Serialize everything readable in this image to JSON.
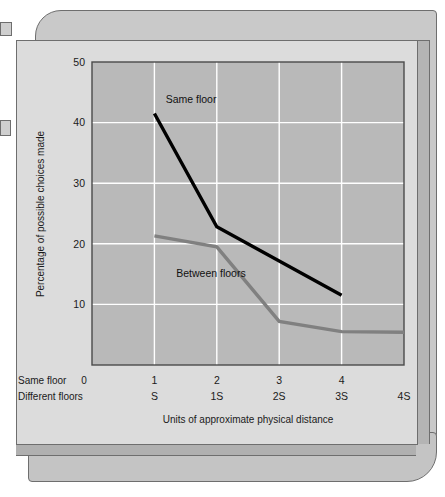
{
  "figure": {
    "kind": "printed-figure-card"
  },
  "chart_data": {
    "type": "line",
    "title": "",
    "xlabel": "Units of approximate physical distance",
    "ylabel": "Percentage of possible choices made",
    "grid": true,
    "legend_position": "inline-annotation",
    "xlim": [
      0,
      5
    ],
    "ylim": [
      0,
      50
    ],
    "yticks": [
      10,
      20,
      30,
      40,
      50
    ],
    "ytick_labels": [
      "10",
      "20",
      "30",
      "40",
      "50"
    ],
    "x_axis_rows": [
      {
        "row_label": "Same floor",
        "origin_label": "0",
        "tick_labels": [
          "1",
          "2",
          "3",
          "4",
          ""
        ]
      },
      {
        "row_label": "Different floors",
        "origin_label": "",
        "tick_labels": [
          "S",
          "1S",
          "2S",
          "3S",
          "4S"
        ]
      }
    ],
    "series": [
      {
        "name": "Same floor",
        "color": "#000000",
        "label_text": "Same floor",
        "x": [
          1,
          2,
          4
        ],
        "values": [
          41.5,
          22.8,
          11.5
        ]
      },
      {
        "name": "Between floors",
        "color": "#808080",
        "label_text": "Between floors",
        "x": [
          1,
          2,
          3,
          4,
          5
        ],
        "values": [
          21.3,
          19.5,
          7.2,
          5.5,
          5.4
        ]
      }
    ],
    "annotations": [
      {
        "text": "Same floor",
        "x": 1.18,
        "y": 43.2
      },
      {
        "text": "Between floors",
        "x": 1.35,
        "y": 14.6
      }
    ],
    "colors": {
      "plot_background": "#b9b9b9",
      "grid_line": "#ffffff",
      "axis_line": "#4a4a4a",
      "card_background": "#dcdcdc",
      "same_floor": "#000000",
      "between_floors": "#808080"
    }
  }
}
